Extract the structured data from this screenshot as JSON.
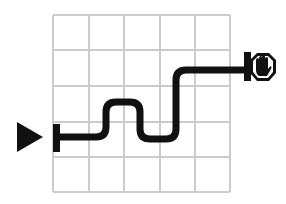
{
  "diagram": {
    "grid": {
      "columns": 5,
      "rows": 5,
      "x_lines": [
        53,
        89,
        124,
        160,
        195,
        230
      ],
      "y_lines": [
        15,
        50,
        86,
        122,
        157,
        192
      ],
      "line_color": "#cccccc"
    },
    "start_marker": {
      "icon": "play-triangle-icon",
      "color": "#111111"
    },
    "end_marker": {
      "icon": "stop-hand-icon",
      "color": "#111111"
    },
    "path_color": "#111111",
    "path_label": "route path",
    "start_label": "start",
    "end_label": "stop"
  }
}
